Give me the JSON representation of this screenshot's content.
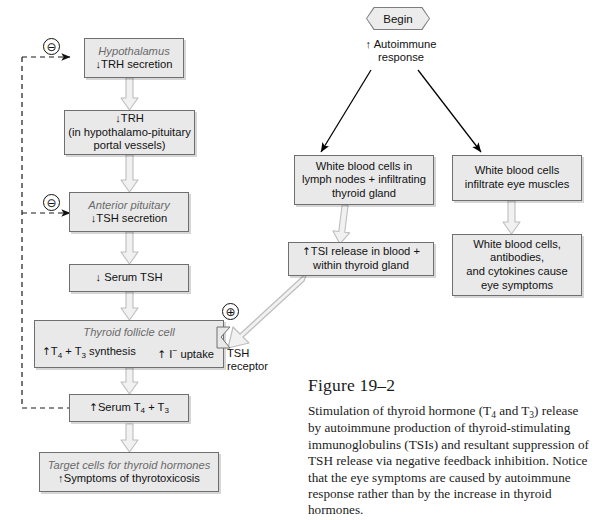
{
  "figure": {
    "number": "Figure 19–2",
    "caption": "Stimulation of thyroid hormone (T4 and T3) release by autoimmune production of thyroid-stimulating immunoglobulins (TSIs) and resultant suppression of TSH release via negative feedback inhibition. Notice that the eye symptoms are caused by autoimmune response rather than by the increase in thyroid hormones."
  },
  "start_node": {
    "label": "Begin"
  },
  "left_column": {
    "hypothalamus": {
      "header": "Hypothalamus",
      "line1": "↓TRH secretion"
    },
    "trh": {
      "line1": "↓TRH",
      "line2": "(in hypothalamo-pituitary",
      "line3": "portal vessels)"
    },
    "anterior_pituitary": {
      "header": "Anterior pituitary",
      "line1": "↓TSH secretion"
    },
    "serum_tsh": {
      "line1": "↓ Serum TSH"
    },
    "thyroid_follicle": {
      "header": "Thyroid follicle cell",
      "left_label": "↑T4 + T3 synthesis",
      "right_label": "↑ I⁻ uptake"
    },
    "tsh_receptor": {
      "line1": "TSH",
      "line2": "receptor"
    },
    "serum_t4t3": {
      "line1": "↑Serum T4 + T3"
    },
    "target_cells": {
      "header": "Target cells for thyroid hormones",
      "line1": "↑Symptoms of thyrotoxicosis"
    }
  },
  "right_column": {
    "autoimmune": {
      "line1": "↑ Autoimmune",
      "line2": "response"
    },
    "wbc_lymph": {
      "line1": "White blood cells in",
      "line2": "lymph nodes + infiltrating",
      "line3": "thyroid gland"
    },
    "wbc_eye": {
      "line1": "White blood cells",
      "line2": "infiltrate eye muscles"
    },
    "tsi_release": {
      "line1": "↑TSI release in blood +",
      "line2": "within thyroid gland"
    },
    "eye_symptoms": {
      "line1": "White blood cells,",
      "line2": "antibodies,",
      "line3": "and cytokines cause",
      "line4": "eye symptoms"
    }
  },
  "signs": {
    "negative_upper": "⊖",
    "negative_lower": "⊖",
    "positive": "⊕"
  },
  "colors": {
    "box_fill": "#e9e9e9",
    "box_border": "#6f6f6f",
    "arrow_fill": "#f0f0f0",
    "arrow_stroke": "#b5b5b5",
    "dashed_line": "#222222",
    "thin_arrow": "#000000",
    "header_text": "#6a6a6a"
  }
}
